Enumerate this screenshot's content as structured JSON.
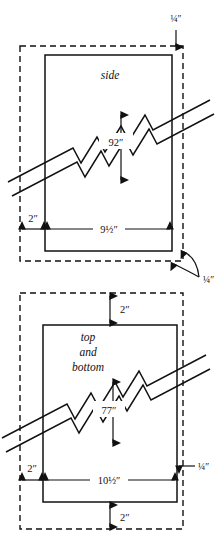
{
  "diagram": {
    "figures": [
      {
        "id": "side-panel",
        "part_label": "side",
        "height_label": "92″",
        "width_label": "9½″",
        "margin_left_label": "2″",
        "top_gap_label": "¼″",
        "corner_gap_label": "¼″"
      },
      {
        "id": "top-bottom-panel",
        "part_label_line1": "top",
        "part_label_line2": "and",
        "part_label_line3": "bottom",
        "height_label": "77″",
        "width_label": "10½″",
        "margin_left_label": "2″",
        "margin_top_label": "2″",
        "margin_bottom_label": "2″",
        "right_gap_label": "¼″"
      }
    ],
    "colors": {
      "ink": "#111111",
      "paper": "#ffffff"
    }
  }
}
